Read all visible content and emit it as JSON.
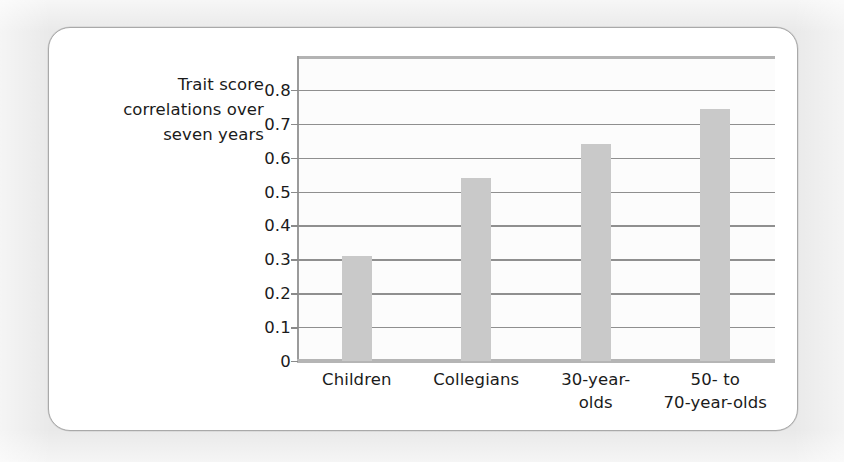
{
  "chart_data": {
    "type": "bar",
    "title": "",
    "subtitle": "",
    "ylabel_lines": [
      "Trait score",
      "correlations over",
      "seven years"
    ],
    "ylabel": "Trait score correlations over seven years",
    "xlabel": "",
    "categories": [
      "Children",
      "Collegians",
      "30-year-olds",
      "50- to 70-year-olds"
    ],
    "category_label_lines": [
      [
        "Children"
      ],
      [
        "Collegians"
      ],
      [
        "30-year-",
        "olds"
      ],
      [
        "50-  to",
        "70-year-olds"
      ]
    ],
    "values": [
      0.31,
      0.54,
      0.64,
      0.745
    ],
    "ylim": [
      0,
      0.9
    ],
    "yticks": [
      0,
      0.1,
      0.2,
      0.3,
      0.4,
      0.5,
      0.6,
      0.7,
      0.8
    ],
    "ytick_labels": [
      "0",
      "0.1",
      "0.2",
      "0.3",
      "0.4",
      "0.5",
      "0.6",
      "0.7",
      "0.8"
    ],
    "grid": true,
    "legend": null,
    "legend_position": "none",
    "annotations": []
  },
  "style": {
    "bar_color": "#c9c9c9",
    "grid_color": "#8f8f8f",
    "axis_color": "#9b9b9b",
    "frame_color": "#b3b3b3",
    "text_color": "#1b1b1b",
    "plot_background": "#fcfcfc",
    "card_background": "#ffffff",
    "card_border_color": "#a9a9a9",
    "page_background": "#e9e9e9"
  }
}
